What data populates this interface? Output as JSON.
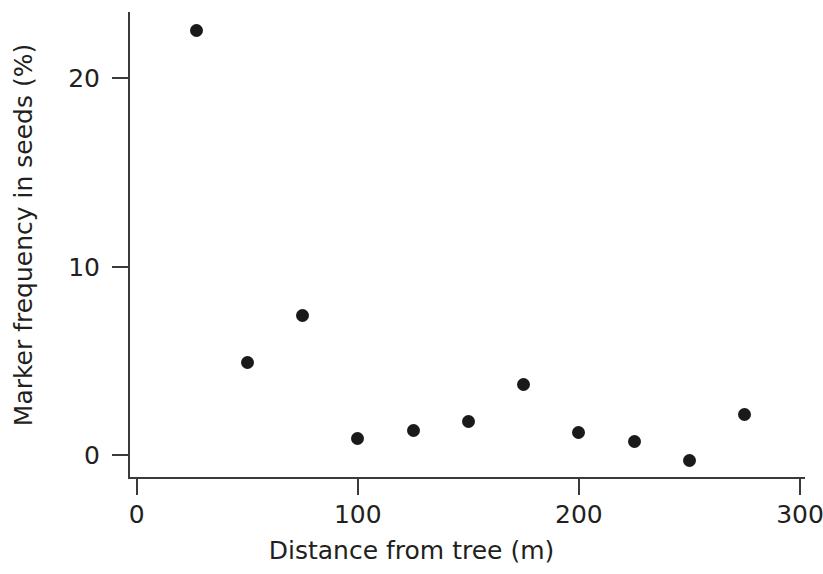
{
  "chart_data": {
    "type": "scatter",
    "title": "",
    "xlabel": "Distance from tree (m)",
    "ylabel": "Marker frequency in seeds (%)",
    "xlim": [
      0,
      300
    ],
    "ylim": [
      0,
      20
    ],
    "xticks": [
      0,
      100,
      200,
      300
    ],
    "xticklabels": [
      "0",
      "100",
      "200",
      "300"
    ],
    "yticks": [
      0,
      10,
      20
    ],
    "yticklabels": [
      "0",
      "10",
      "20"
    ],
    "grid": false,
    "legend": null,
    "marker": "filled-circle",
    "marker_color": "#1a1a1a",
    "x": [
      27,
      50,
      75,
      100,
      125,
      150,
      175,
      200,
      225,
      250,
      275
    ],
    "y": [
      22.5,
      4.9,
      7.4,
      0.85,
      1.3,
      1.8,
      3.75,
      1.2,
      0.7,
      -0.3,
      2.15
    ],
    "points": [
      {
        "x": 27,
        "y": 22.5
      },
      {
        "x": 50,
        "y": 4.9
      },
      {
        "x": 75,
        "y": 7.4
      },
      {
        "x": 100,
        "y": 0.85
      },
      {
        "x": 125,
        "y": 1.3
      },
      {
        "x": 150,
        "y": 1.8
      },
      {
        "x": 175,
        "y": 3.75
      },
      {
        "x": 200,
        "y": 1.2
      },
      {
        "x": 225,
        "y": 0.7
      },
      {
        "x": 250,
        "y": -0.3
      },
      {
        "x": 275,
        "y": 2.15
      }
    ]
  }
}
